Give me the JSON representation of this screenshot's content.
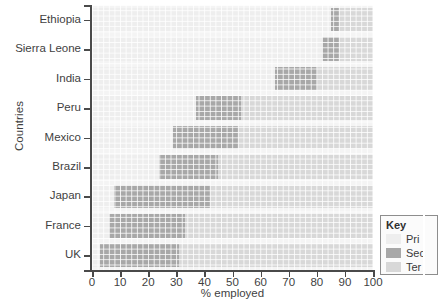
{
  "chart_data": {
    "type": "bar",
    "orientation": "horizontal",
    "stacked": true,
    "title": "",
    "xlabel": "% employed",
    "ylabel": "Countries",
    "xlim": [
      0,
      100
    ],
    "xticks": [
      0,
      10,
      20,
      30,
      40,
      50,
      60,
      70,
      80,
      90,
      100
    ],
    "grid": true,
    "legend_position": "right-bottom",
    "categories": [
      "UK",
      "France",
      "Japan",
      "Brazil",
      "Mexico",
      "Peru",
      "India",
      "Sierra Leone",
      "Ethiopia"
    ],
    "series": [
      {
        "name": "Primary",
        "color": "#eeeeee",
        "values": [
          3,
          6,
          8,
          24,
          29,
          37,
          65,
          82,
          85
        ]
      },
      {
        "name": "Secondary",
        "color": "#a8a8a8",
        "values": [
          28,
          27,
          34,
          21,
          23,
          16,
          15,
          6,
          3
        ]
      },
      {
        "name": "Tertiary",
        "color": "#d8d8d8",
        "values": [
          69,
          67,
          58,
          55,
          48,
          47,
          20,
          12,
          12
        ]
      }
    ]
  },
  "axes": {
    "y_title": "Countries",
    "x_title": "% employed",
    "y_labels": [
      "Ethiopia",
      "Sierra Leone",
      "India",
      "Peru",
      "Mexico",
      "Brazil",
      "Japan",
      "France",
      "UK"
    ],
    "x_labels": [
      "0",
      "10",
      "20",
      "30",
      "40",
      "50",
      "60",
      "70",
      "80",
      "90",
      "100"
    ]
  },
  "legend": {
    "title": "Key",
    "items": [
      {
        "label": "Pri",
        "color": "#eeeeee",
        "icon": "legend-swatch-primary"
      },
      {
        "label": "Sec",
        "color": "#a8a8a8",
        "icon": "legend-swatch-secondary"
      },
      {
        "label": "Ter",
        "color": "#d8d8d8",
        "icon": "legend-swatch-tertiary"
      }
    ]
  }
}
